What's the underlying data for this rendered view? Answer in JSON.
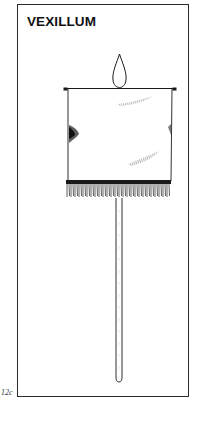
{
  "figure": {
    "title": "VEXILLUM",
    "plate_label": "12c",
    "parts": [
      "flame-finial",
      "crossbar",
      "banner",
      "fringe",
      "pole"
    ]
  },
  "colors": {
    "ink": "#1a1a1a",
    "paper": "#ffffff",
    "frame": "#2a2a2a"
  }
}
